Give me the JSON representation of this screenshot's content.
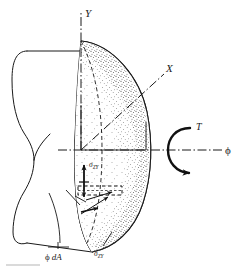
{
  "figure": {
    "type": "engineering-diagram",
    "background_color": "#ffffff",
    "line_color": "#1a1a1a",
    "stipple_color": "#202020"
  },
  "axes": {
    "y_axis": {
      "label": "Y",
      "orientation": "vertical",
      "line_style": "dash-dot",
      "from": [
        81,
        150
      ],
      "to": [
        81,
        10
      ]
    },
    "x_axis": {
      "label": "X",
      "orientation": "oblique-up-right",
      "line_style": "dash-dot",
      "from": [
        81,
        150
      ],
      "to": [
        166,
        72
      ]
    },
    "z_axis": {
      "label": "ϕ",
      "orientation": "horizontal",
      "line_style": "dash-dot",
      "from": [
        60,
        150
      ],
      "to": [
        228,
        150
      ]
    }
  },
  "torque": {
    "label": "T",
    "symbol": "circular-arrow",
    "description": "curved arrow about the shaft axis indicating applied torque",
    "center": [
      186,
      150
    ]
  },
  "stresses": [
    {
      "name": "sigma-zy-upper",
      "base": "σ",
      "subscript": "ZY",
      "arrow": "vertical-up",
      "position": [
        88,
        163
      ]
    },
    {
      "name": "sigma-zy-lower",
      "base": "σ",
      "subscript": "ZY",
      "arrow": "leader-line-to-section-edge",
      "position": [
        100,
        252
      ]
    }
  ],
  "area_element": {
    "label_base": "ϕ",
    "label_rest": "dA",
    "full_label": "ϕ dA",
    "shape": "dashed-rectangle",
    "position": [
      58,
      253
    ],
    "description": "differential area element dA on the cut cross-section with leader line"
  },
  "shaft": {
    "description": "cylindrical bar shown in perspective, cut by a plane to expose a stippled cross-section",
    "outline_style": "solid",
    "hidden_edge_style": "dashed"
  },
  "labels_visible": [
    "Y",
    "X",
    "ϕ",
    "T",
    "σZY",
    "σZY",
    "ϕ dA"
  ]
}
